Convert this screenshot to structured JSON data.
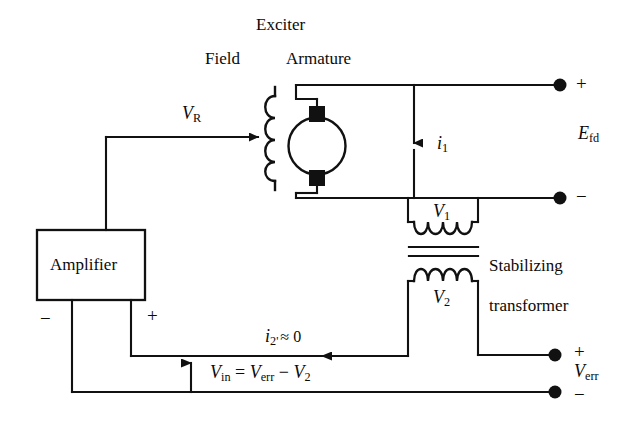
{
  "figure": {
    "type": "circuit-diagram",
    "background_color": "#ffffff",
    "line_color": "#111111"
  },
  "labels": {
    "exciter": "Exciter",
    "field": "Field",
    "armature": "Armature",
    "amplifier": "Amplifier",
    "stabilizing_transformer_line1": "Stabilizing",
    "stabilizing_transformer_line2": "transformer",
    "v_r": "V",
    "v_r_sub": "R",
    "e_fd": "E",
    "e_fd_sub": "fd",
    "i_1": "i",
    "i_1_sub": "1",
    "v_1": "V",
    "v_1_sub": "1",
    "v_2": "V",
    "v_2_sub": "2",
    "i_2_current": "i",
    "i_2_sub": "2'",
    "i_2_value": "≈ 0",
    "v_in_expr_v": "V",
    "v_in_expr_in": "in",
    "v_in_eq": " = ",
    "v_in_verr": "V",
    "v_in_verr_sub": "err",
    "v_in_minus": " − ",
    "v_in_v2": "V",
    "v_in_v2_sub": "2",
    "v_err": "V",
    "v_err_sub": "err",
    "plus": "+",
    "minus": "−"
  },
  "terminals": {
    "efd_positive": "+",
    "efd_negative": "−",
    "verr_positive": "+",
    "verr_negative": "−",
    "amplifier_negative": "−",
    "amplifier_positive": "+"
  },
  "components": [
    {
      "name": "field-coil",
      "kind": "inductor",
      "turns": 4,
      "orientation": "vertical"
    },
    {
      "name": "armature",
      "kind": "dc-machine",
      "orientation": "vertical",
      "brushes": 2
    },
    {
      "name": "amplifier-block",
      "kind": "block",
      "label": "Amplifier"
    },
    {
      "name": "stabilizing-transformer",
      "kind": "transformer",
      "primary_label": "V1",
      "secondary_label": "V2",
      "core_lines": 2
    }
  ],
  "arrows": [
    {
      "name": "vr-arrow",
      "direction": "right",
      "label": "V_R"
    },
    {
      "name": "i1-arrow",
      "direction": "down",
      "label": "i_1"
    },
    {
      "name": "i2-arrow",
      "direction": "left",
      "label": "i_2' approx 0"
    },
    {
      "name": "vin-arrow",
      "direction": "up",
      "label": "V_in"
    }
  ]
}
